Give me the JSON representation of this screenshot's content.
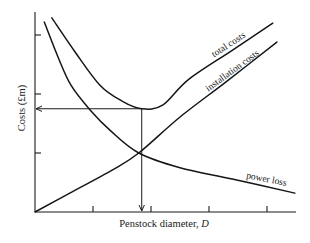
{
  "chart_data": {
    "type": "line",
    "title": "",
    "xlabel": "Penstock diameter, D",
    "ylabel": "Costs (£m)",
    "xlim": [
      0,
      4.5
    ],
    "ylim": [
      0,
      3.39
    ],
    "x_ticks": [
      1,
      2,
      3,
      4
    ],
    "y_ticks": [
      1,
      2,
      3
    ],
    "tick_labels_shown": false,
    "grid": false,
    "legend": "none (curves labelled inline)",
    "series": [
      {
        "name": "total costs",
        "points": [
          [
            0.29,
            3.29
          ],
          [
            0.7,
            2.7
          ],
          [
            1.12,
            2.15
          ],
          [
            1.5,
            1.88
          ],
          [
            1.84,
            1.75
          ],
          [
            2.2,
            1.81
          ],
          [
            2.64,
            2.24
          ],
          [
            3.4,
            2.74
          ],
          [
            4.1,
            3.2
          ]
        ]
      },
      {
        "name": "installation costs",
        "points": [
          [
            0,
            0
          ],
          [
            0.6,
            0.32
          ],
          [
            1.33,
            0.71
          ],
          [
            1.79,
            1.0
          ],
          [
            2.5,
            1.61
          ],
          [
            3.3,
            2.21
          ],
          [
            4.17,
            2.88
          ]
        ]
      },
      {
        "name": "power loss",
        "points": [
          [
            0.16,
            3.22
          ],
          [
            0.4,
            2.62
          ],
          [
            0.62,
            2.15
          ],
          [
            0.95,
            1.73
          ],
          [
            1.3,
            1.38
          ],
          [
            1.79,
            1.0
          ],
          [
            2.5,
            0.75
          ],
          [
            3.4,
            0.56
          ],
          [
            4.48,
            0.32
          ]
        ]
      }
    ],
    "annotations": [
      {
        "type": "arrow-vertical",
        "from": [
          1.84,
          1.75
        ],
        "to": [
          1.84,
          0
        ],
        "meaning": "optimum penstock diameter"
      },
      {
        "type": "arrow-horizontal",
        "from": [
          1.84,
          1.75
        ],
        "to": [
          0,
          1.75
        ],
        "meaning": "minimum total cost"
      }
    ],
    "optimum": {
      "x": 1.84,
      "y": 1.75
    }
  },
  "labels": {
    "total": "total costs",
    "installation": "installation costs",
    "power": "power loss",
    "xlabel_text": "Penstock diameter, ",
    "xlabel_var": "D",
    "ylabel": "Costs (£m)"
  }
}
